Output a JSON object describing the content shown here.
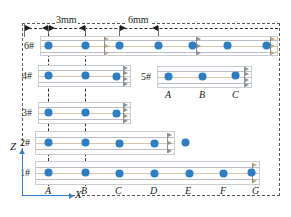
{
  "figure": {
    "kind": "beam-sensor-layout-diagram",
    "dimensions": [
      {
        "id": "dim-3mm",
        "label": "3mm",
        "from_x": 38,
        "to_x": 85
      },
      {
        "id": "dim-6mm",
        "label": "6mm",
        "from_x": 110,
        "to_x": 158
      }
    ],
    "axes": {
      "z_label": "Z",
      "x_label": "X"
    },
    "stations": {
      "main": [
        "A",
        "B",
        "C",
        "D",
        "E",
        "F",
        "G"
      ],
      "inset": [
        "A",
        "B",
        "C"
      ]
    },
    "beams": [
      {
        "id": "beam-6",
        "label": "6#",
        "sensor_count": 7,
        "sensor_stations": [
          "A",
          "B",
          "C",
          "D",
          "E",
          "F",
          "G"
        ]
      },
      {
        "id": "beam-4",
        "label": "4#",
        "sensor_count": 3,
        "sensor_stations": [
          "A",
          "B",
          "C"
        ]
      },
      {
        "id": "beam-3",
        "label": "3#",
        "sensor_count": 3,
        "sensor_stations": [
          "A",
          "B",
          "C"
        ]
      },
      {
        "id": "beam-2",
        "label": "2#",
        "sensor_count": 5,
        "sensor_stations": [
          "A",
          "B",
          "C",
          "D",
          "E"
        ]
      },
      {
        "id": "beam-1",
        "label": "1#",
        "sensor_count": 7,
        "sensor_stations": [
          "A",
          "B",
          "C",
          "D",
          "E",
          "F",
          "G"
        ]
      },
      {
        "id": "beam-5",
        "label": "5#",
        "sensor_count": 3,
        "sensor_stations": [
          "A",
          "B",
          "C"
        ]
      }
    ],
    "colors": {
      "sensor": "#2e7fc1",
      "beam_outline": "#c9cdd2",
      "beam_line": "#b9bec4",
      "beam_line_warm": "#d9c6ad",
      "dimension": "#1d1d1d",
      "station_dash": "#2b2b2b",
      "axis": "#3f7fbf",
      "outer_dash": "#5a5a5a"
    },
    "station_labels": {
      "A": "A",
      "B": "B",
      "C": "C",
      "D": "D",
      "E": "E",
      "F": "F",
      "G": "G"
    },
    "inset_station_labels": {
      "A": "A",
      "B": "B",
      "C": "C"
    }
  }
}
